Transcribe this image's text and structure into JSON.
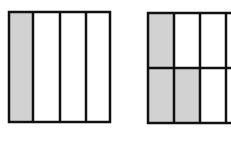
{
  "figures": [
    {
      "name": "fraction-bar-1-of-4",
      "rows": 1,
      "cols": 4,
      "shaded_cells": [
        [
          0,
          0
        ]
      ],
      "fraction": "1/4"
    },
    {
      "name": "fraction-grid-partial",
      "rows": 2,
      "cols": 4,
      "visible_cols": 3.2,
      "shaded_cells": [
        [
          0,
          0
        ],
        [
          1,
          0
        ],
        [
          1,
          1
        ]
      ],
      "note": "figure cropped at right edge"
    }
  ],
  "colors": {
    "shade": "#d2d2d2",
    "stroke": "#111111",
    "background": "#ffffff"
  }
}
